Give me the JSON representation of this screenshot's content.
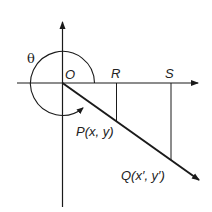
{
  "diagram": {
    "type": "rotation-coordinate-diagram",
    "angle_label": "θ",
    "origin_label": "O",
    "points": {
      "R": {
        "label": "R"
      },
      "S": {
        "label": "S"
      },
      "P": {
        "label": "P(x, y)"
      },
      "Q": {
        "label": "Q(x′, y′)"
      }
    },
    "colors": {
      "stroke": "#1a1a1a",
      "background": "#ffffff"
    }
  }
}
